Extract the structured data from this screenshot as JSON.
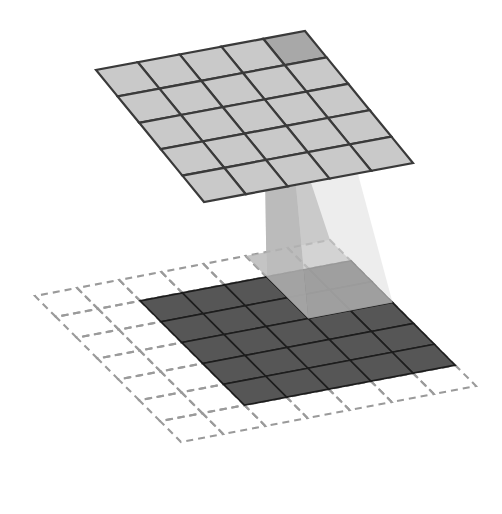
{
  "figure": {
    "type": "isometric-grid-projection"
  },
  "colors": {
    "background": "#ffffff",
    "top_plane_fill": "#c9c9c9",
    "top_plane_highlight_fill": "#a8a8a8",
    "top_plane_stroke": "#3a3a3a",
    "bottom_plane_fill": "#565656",
    "bottom_plane_highlight_fill": "#2f2f2f",
    "bottom_plane_stroke": "#1d1d1d",
    "dashed_grid_stroke": "#9a9a9a",
    "frustum_left_face": "#b4b4b4",
    "frustum_right_face": "#dedede",
    "frustum_base_overlay": "#b4b4b4"
  },
  "top_plane": {
    "name": "upper-feature-map",
    "rows": 5,
    "cols": 5,
    "highlight_cell": {
      "row": 0,
      "col": 0
    },
    "quad": {
      "top": [
        305,
        31
      ],
      "right": [
        413,
        163
      ],
      "bottom": [
        200,
        205
      ],
      "left": [
        96,
        70
      ]
    }
  },
  "bottom_plane": {
    "name": "lower-input-map",
    "solid_rows": 5,
    "solid_cols": 5,
    "dashed_rows": 7,
    "dashed_cols": 7,
    "highlight_rows": 2,
    "highlight_cols": 2,
    "highlight_origin": {
      "row": 0,
      "col": 0
    },
    "dashed_quad": {
      "top": [
        330,
        240
      ],
      "right": [
        476,
        386
      ],
      "bottom": [
        186,
        496
      ],
      "left": [
        35,
        296
      ]
    }
  },
  "frustum": {
    "name": "projection-frustum",
    "apex_cell_rows": 1,
    "apex_cell_cols": 1,
    "base_cell_rows": 2,
    "base_cell_cols": 2,
    "left_face_opacity": 0.78,
    "right_face_opacity": 0.55,
    "base_opacity": 0.55
  },
  "geometry": {
    "top_u_step": [
      21.6,
      26.4
    ],
    "top_v_step": [
      -20.8,
      27.8
    ],
    "bottom_u_step": [
      20.9,
      20.9
    ],
    "bottom_v_step": [
      -21.5,
      28.0
    ]
  }
}
